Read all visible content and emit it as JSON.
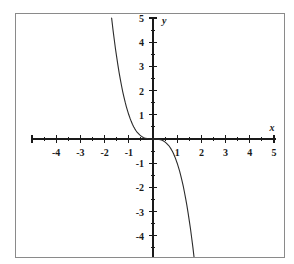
{
  "figure": {
    "title": "",
    "background_color": "#ffffff",
    "frame_color": "#8a8a8a",
    "axis_color": "#1a1a1a",
    "curve_color": "#2b2b2b"
  },
  "axis_labels": {
    "x": "x",
    "y": "y"
  },
  "chart_data": {
    "type": "line",
    "title": "",
    "subtitle": "",
    "xlabel": "x",
    "ylabel": "y",
    "xlim": [
      -5,
      5
    ],
    "ylim": [
      -5,
      5
    ],
    "grid": false,
    "legend": null,
    "legend_position": "none",
    "x_major_ticks": [
      -5,
      -4,
      -3,
      -2,
      -1,
      0,
      1,
      2,
      3,
      4,
      5
    ],
    "x_tick_labels": [
      "",
      "-4",
      "-3",
      "-2",
      "-1",
      "",
      "1",
      "2",
      "3",
      "4",
      "5"
    ],
    "x_minor_ticks": [
      -4.5,
      -3.5,
      -2.5,
      -1.5,
      -0.5,
      0.5,
      1.5,
      2.5,
      3.5,
      4.5
    ],
    "y_major_ticks": [
      -5,
      -4,
      -3,
      -2,
      -1,
      0,
      1,
      2,
      3,
      4,
      5
    ],
    "y_tick_labels": [
      "",
      "-4",
      "-3",
      "-2",
      "-1",
      "",
      "1",
      "2",
      "3",
      "4",
      "5"
    ],
    "y_minor_ticks": [
      -4.5,
      -3.5,
      -2.5,
      -1.5,
      -0.5,
      0.5,
      1.5,
      2.5,
      3.5,
      4.5
    ],
    "series": [
      {
        "name": "y = -x^3",
        "equation": "y = -x^3",
        "x": [
          -1.71,
          -1.65,
          -1.6,
          -1.55,
          -1.5,
          -1.45,
          -1.4,
          -1.35,
          -1.3,
          -1.25,
          -1.2,
          -1.15,
          -1.1,
          -1.05,
          -1.0,
          -0.95,
          -0.9,
          -0.85,
          -0.8,
          -0.75,
          -0.7,
          -0.65,
          -0.6,
          -0.55,
          -0.5,
          -0.45,
          -0.4,
          -0.35,
          -0.3,
          -0.25,
          -0.2,
          -0.15,
          -0.1,
          -0.05,
          0.0,
          0.05,
          0.1,
          0.15,
          0.2,
          0.25,
          0.3,
          0.35,
          0.4,
          0.45,
          0.5,
          0.55,
          0.6,
          0.65,
          0.7,
          0.75,
          0.8,
          0.85,
          0.9,
          0.95,
          1.0,
          1.05,
          1.1,
          1.15,
          1.2,
          1.25,
          1.3,
          1.35,
          1.4,
          1.45,
          1.5,
          1.55,
          1.6,
          1.65,
          1.71
        ],
        "values": [
          5.0,
          4.49,
          4.1,
          3.72,
          3.38,
          3.05,
          2.74,
          2.46,
          2.2,
          1.95,
          1.73,
          1.52,
          1.33,
          1.16,
          1.0,
          0.86,
          0.73,
          0.61,
          0.51,
          0.42,
          0.34,
          0.27,
          0.22,
          0.17,
          0.13,
          0.09,
          0.06,
          0.04,
          0.03,
          0.02,
          0.01,
          0.003,
          0.001,
          0.0,
          0.0,
          0.0,
          -0.001,
          -0.003,
          -0.01,
          -0.02,
          -0.03,
          -0.04,
          -0.06,
          -0.09,
          -0.13,
          -0.17,
          -0.22,
          -0.27,
          -0.34,
          -0.42,
          -0.51,
          -0.61,
          -0.73,
          -0.86,
          -1.0,
          -1.16,
          -1.33,
          -1.52,
          -1.73,
          -1.95,
          -2.2,
          -2.46,
          -2.74,
          -3.05,
          -3.38,
          -3.72,
          -4.1,
          -4.49,
          -5.0
        ]
      }
    ]
  }
}
